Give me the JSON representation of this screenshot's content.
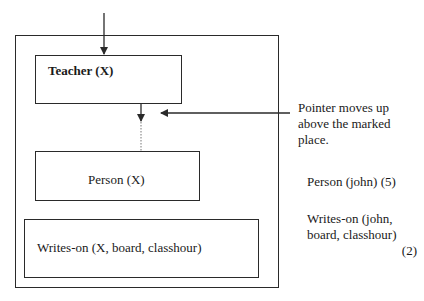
{
  "diagram": {
    "outer_box": {
      "name": "Stack frame"
    },
    "boxes": [
      {
        "id": "teacher",
        "label": "Teacher (X)",
        "bold": true
      },
      {
        "id": "person",
        "label": "Person (X)",
        "bold": false
      },
      {
        "id": "writes_on",
        "label": "Writes-on (X, board, classhour)",
        "bold": false
      }
    ],
    "annotations": {
      "pointer_note": "Pointer moves up above the marked place.",
      "pointer_note_lines": [
        "Pointer moves up",
        "above the marked",
        "place."
      ],
      "fact1": "Person (john) (5)",
      "fact2_lines": [
        "Writes-on (john,",
        "board, classhour)"
      ],
      "fact2_number": "(2)"
    },
    "colors": {
      "stroke": "#2a2a2a",
      "background": "#ffffff"
    }
  }
}
